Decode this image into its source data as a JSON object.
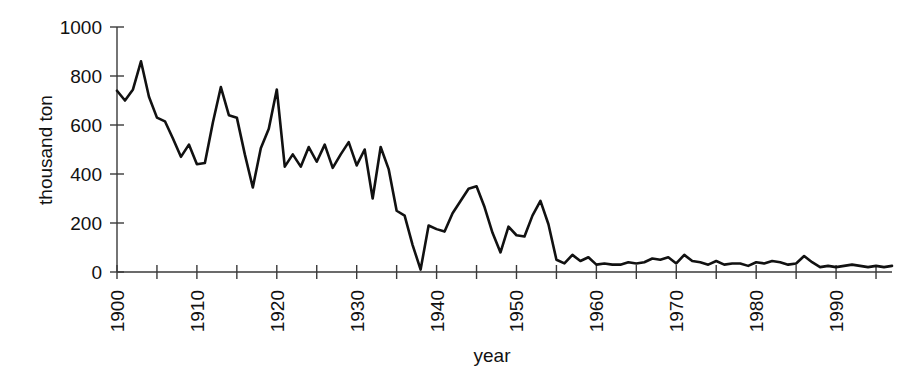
{
  "chart_data": {
    "type": "line",
    "title": "",
    "subtitle": "",
    "xlabel": "year",
    "ylabel": "thousand ton",
    "xlim": [
      1900,
      1997
    ],
    "ylim": [
      0,
      1000
    ],
    "grid": false,
    "legend": null,
    "y_ticks": [
      0,
      200,
      400,
      600,
      800,
      1000
    ],
    "y_tick_labels": [
      "0",
      "200",
      "400",
      "600",
      "800",
      "1000"
    ],
    "x_ticks": [
      1900,
      1905,
      1910,
      1915,
      1920,
      1925,
      1930,
      1935,
      1940,
      1945,
      1950,
      1955,
      1960,
      1965,
      1970,
      1975,
      1980,
      1985,
      1990,
      1995
    ],
    "x_tick_labels": [
      "1900",
      "",
      "1910",
      "",
      "1920",
      "",
      "1930",
      "",
      "1940",
      "",
      "1950",
      "",
      "1960",
      "",
      "1970",
      "",
      "1980",
      "",
      "1990",
      ""
    ],
    "x_major_labels": [
      "1900",
      "1910",
      "1920",
      "1930",
      "1940",
      "1950",
      "1960",
      "1970",
      "1980",
      "1990"
    ],
    "series": [
      {
        "name": "catch",
        "color": "#111111",
        "x": [
          1900,
          1901,
          1902,
          1903,
          1904,
          1905,
          1906,
          1907,
          1908,
          1909,
          1910,
          1911,
          1912,
          1913,
          1914,
          1915,
          1916,
          1917,
          1918,
          1919,
          1920,
          1921,
          1922,
          1923,
          1924,
          1925,
          1926,
          1927,
          1928,
          1929,
          1930,
          1931,
          1932,
          1933,
          1934,
          1935,
          1936,
          1937,
          1938,
          1939,
          1940,
          1941,
          1942,
          1943,
          1944,
          1945,
          1946,
          1947,
          1948,
          1949,
          1950,
          1951,
          1952,
          1953,
          1954,
          1955,
          1956,
          1957,
          1958,
          1959,
          1960,
          1961,
          1962,
          1963,
          1964,
          1965,
          1966,
          1967,
          1968,
          1969,
          1970,
          1971,
          1972,
          1973,
          1974,
          1975,
          1976,
          1977,
          1978,
          1979,
          1980,
          1981,
          1982,
          1983,
          1984,
          1985,
          1986,
          1987,
          1988,
          1989,
          1990,
          1991,
          1992,
          1993,
          1994,
          1995,
          1996,
          1997
        ],
        "y": [
          740,
          700,
          745,
          860,
          715,
          630,
          615,
          545,
          470,
          520,
          440,
          445,
          610,
          755,
          640,
          630,
          480,
          345,
          505,
          585,
          745,
          430,
          480,
          430,
          510,
          450,
          520,
          425,
          480,
          530,
          435,
          500,
          300,
          510,
          420,
          250,
          230,
          110,
          10,
          190,
          175,
          165,
          240,
          290,
          340,
          350,
          265,
          160,
          80,
          185,
          150,
          145,
          230,
          290,
          195,
          50,
          35,
          70,
          45,
          60,
          30,
          35,
          30,
          30,
          40,
          35,
          40,
          55,
          50,
          60,
          35,
          70,
          45,
          40,
          30,
          45,
          30,
          35,
          35,
          25,
          40,
          35,
          45,
          40,
          30,
          35,
          65,
          40,
          20,
          25,
          20,
          25,
          30,
          25,
          20,
          25,
          20,
          25
        ]
      }
    ]
  },
  "axes": {
    "y_axis_title": "thousand ton",
    "x_axis_title": "year"
  }
}
